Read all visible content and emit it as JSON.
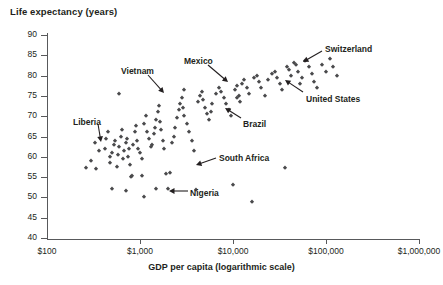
{
  "chart_data": {
    "type": "scatter",
    "title": "",
    "ylabel": "Life expectancy (years)",
    "xlabel": "GDP per capita (logarithmic scale)",
    "xscale": "log",
    "xlim": [
      100,
      1000000
    ],
    "ylim": [
      40,
      90
    ],
    "yticks": [
      40,
      45,
      50,
      55,
      60,
      65,
      70,
      75,
      80,
      85,
      90
    ],
    "ytick_labels": [
      "40",
      "45",
      "50",
      "55",
      "60",
      "65",
      "70",
      "75",
      "80",
      "85",
      "90"
    ],
    "xticks": [
      100,
      1000,
      10000,
      100000,
      1000000
    ],
    "xtick_labels": [
      "$100",
      "$1,000",
      "$10,000",
      "$100,000",
      "$1,000,000"
    ],
    "grid": false,
    "legend": null,
    "marker": "diamond",
    "marker_color": "#4a4a4c",
    "points": [
      [
        330,
        63.5
      ],
      [
        300,
        59.0
      ],
      [
        340,
        57.0
      ],
      [
        360,
        61.5
      ],
      [
        420,
        62.0
      ],
      [
        430,
        64.5
      ],
      [
        450,
        66.0
      ],
      [
        470,
        60.0
      ],
      [
        480,
        58.5
      ],
      [
        500,
        61.0
      ],
      [
        520,
        63.0
      ],
      [
        540,
        64.0
      ],
      [
        560,
        57.5
      ],
      [
        580,
        60.5
      ],
      [
        600,
        62.5
      ],
      [
        620,
        65.0
      ],
      [
        640,
        66.5
      ],
      [
        660,
        59.5
      ],
      [
        680,
        61.5
      ],
      [
        700,
        63.5
      ],
      [
        720,
        64.5
      ],
      [
        740,
        60.0
      ],
      [
        760,
        62.0
      ],
      [
        780,
        58.0
      ],
      [
        800,
        55.0
      ],
      [
        820,
        55.2
      ],
      [
        850,
        63.0
      ],
      [
        880,
        66.0
      ],
      [
        900,
        67.5
      ],
      [
        930,
        64.0
      ],
      [
        960,
        62.0
      ],
      [
        1000,
        61.0
      ],
      [
        1050,
        59.5
      ],
      [
        1100,
        68.0
      ],
      [
        1150,
        70.0
      ],
      [
        1200,
        66.0
      ],
      [
        1250,
        64.5
      ],
      [
        1300,
        62.5
      ],
      [
        1350,
        63.0
      ],
      [
        1400,
        65.5
      ],
      [
        1450,
        67.0
      ],
      [
        1500,
        69.0
      ],
      [
        1550,
        71.0
      ],
      [
        1600,
        72.5
      ],
      [
        1650,
        68.5
      ],
      [
        1700,
        66.5
      ],
      [
        1750,
        64.0
      ],
      [
        1800,
        62.0
      ],
      [
        1900,
        55.8
      ],
      [
        2000,
        52.0
      ],
      [
        2100,
        56.0
      ],
      [
        2200,
        63.5
      ],
      [
        2300,
        65.0
      ],
      [
        2400,
        67.0
      ],
      [
        2500,
        69.5
      ],
      [
        2600,
        71.5
      ],
      [
        2700,
        73.0
      ],
      [
        2800,
        74.5
      ],
      [
        2900,
        72.0
      ],
      [
        3000,
        70.0
      ],
      [
        3200,
        68.0
      ],
      [
        3400,
        66.0
      ],
      [
        3600,
        64.0
      ],
      [
        3800,
        61.5
      ],
      [
        4000,
        51.8
      ],
      [
        4200,
        73.5
      ],
      [
        4400,
        75.0
      ],
      [
        4600,
        76.0
      ],
      [
        4800,
        74.0
      ],
      [
        5000,
        72.0
      ],
      [
        5200,
        70.5
      ],
      [
        5500,
        69.0
      ],
      [
        5800,
        71.0
      ],
      [
        6000,
        73.0
      ],
      [
        6500,
        75.5
      ],
      [
        7000,
        77.0
      ],
      [
        7500,
        76.0
      ],
      [
        8000,
        74.5
      ],
      [
        8500,
        73.0
      ],
      [
        9000,
        71.5
      ],
      [
        9500,
        70.0
      ],
      [
        10000,
        53.0
      ],
      [
        10500,
        76.5
      ],
      [
        11000,
        77.5
      ],
      [
        11500,
        75.0
      ],
      [
        12000,
        73.5
      ],
      [
        12500,
        78.0
      ],
      [
        13000,
        79.0
      ],
      [
        14000,
        77.0
      ],
      [
        15000,
        75.5
      ],
      [
        16000,
        48.8
      ],
      [
        17000,
        79.5
      ],
      [
        18000,
        80.0
      ],
      [
        19000,
        78.5
      ],
      [
        20000,
        77.0
      ],
      [
        22000,
        75.0
      ],
      [
        24000,
        79.0
      ],
      [
        26000,
        80.5
      ],
      [
        28000,
        81.0
      ],
      [
        30000,
        79.5
      ],
      [
        32000,
        78.0
      ],
      [
        34000,
        76.5
      ],
      [
        36000,
        57.2
      ],
      [
        38000,
        82.0
      ],
      [
        40000,
        81.5
      ],
      [
        42000,
        80.0
      ],
      [
        45000,
        83.0
      ],
      [
        48000,
        82.5
      ],
      [
        50000,
        81.0
      ],
      [
        55000,
        79.5
      ],
      [
        60000,
        83.5
      ],
      [
        65000,
        82.0
      ],
      [
        70000,
        80.5
      ],
      [
        75000,
        78.5
      ],
      [
        80000,
        77.0
      ],
      [
        90000,
        82.5
      ],
      [
        100000,
        81.0
      ],
      [
        110000,
        84.0
      ],
      [
        120000,
        82.0
      ],
      [
        130000,
        80.0
      ],
      [
        600,
        75.5
      ],
      [
        3000,
        76.5
      ],
      [
        11000,
        74.5
      ],
      [
        52000,
        78.0
      ],
      [
        500,
        52.0
      ],
      [
        700,
        51.5
      ],
      [
        1100,
        50.0
      ],
      [
        1500,
        52.0
      ],
      [
        260,
        57.2
      ],
      [
        1050,
        55.3
      ]
    ],
    "annotations": [
      {
        "label": "Vietnam",
        "label_x": 121,
        "label_y": 66,
        "arrow": [
          148,
          75,
          164,
          93
        ]
      },
      {
        "label": "Mexico",
        "label_x": 184,
        "label_y": 56,
        "arrow": [
          208,
          65,
          228,
          82
        ]
      },
      {
        "label": "Switzerland",
        "label_x": 325,
        "label_y": 44,
        "arrow": [
          322,
          51,
          303,
          62
        ]
      },
      {
        "label": "United States",
        "label_x": 306,
        "label_y": 94,
        "arrow": [
          303,
          92,
          285,
          80
        ]
      },
      {
        "label": "Brazil",
        "label_x": 243,
        "label_y": 119,
        "arrow": [
          241,
          118,
          225,
          108
        ]
      },
      {
        "label": "Liberia",
        "label_x": 73,
        "label_y": 117,
        "arrow": [
          98,
          124,
          101,
          142
        ]
      },
      {
        "label": "South Africa",
        "label_x": 219,
        "label_y": 153,
        "arrow": [
          216,
          158,
          196,
          165
        ]
      },
      {
        "label": "Nigeria",
        "label_x": 190,
        "label_y": 188,
        "arrow": [
          188,
          191,
          169,
          191
        ]
      }
    ]
  }
}
